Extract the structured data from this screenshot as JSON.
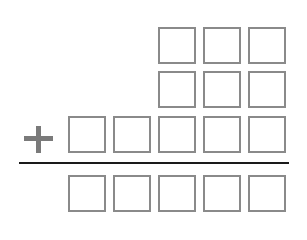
{
  "diagram": {
    "type": "column-addition-template",
    "operator": "+",
    "columns": 5,
    "rows": [
      {
        "name": "addend-1",
        "boxes": 3,
        "align": "right",
        "values": [
          "",
          "",
          ""
        ]
      },
      {
        "name": "addend-2",
        "boxes": 3,
        "align": "right",
        "values": [
          "",
          "",
          ""
        ]
      },
      {
        "name": "addend-3",
        "boxes": 5,
        "align": "right",
        "values": [
          "",
          "",
          "",
          "",
          ""
        ]
      },
      {
        "name": "sum",
        "boxes": 5,
        "align": "right",
        "values": [
          "",
          "",
          "",
          "",
          ""
        ]
      }
    ],
    "colors": {
      "box_border": "#8a8a8a",
      "operator": "#7a7a7a",
      "line": "#1a1a1a"
    }
  }
}
